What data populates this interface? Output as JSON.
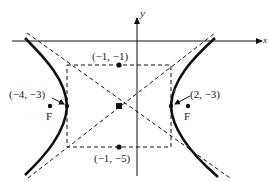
{
  "diagram": {
    "type": "hyperbola",
    "title": "",
    "axes": {
      "x_label": "x",
      "y_label": "y"
    },
    "center": {
      "label": "(-1, -3)",
      "coords": [
        -1,
        -3
      ]
    },
    "vertices": [
      {
        "label": "(−4, −3)",
        "coords": [
          -4,
          -3
        ]
      },
      {
        "label": "(2, −3)",
        "coords": [
          2,
          -3
        ]
      }
    ],
    "co_vertices": [
      {
        "label": "(−1, −1)",
        "coords": [
          -1,
          -1
        ]
      },
      {
        "label": "(−1, −5)",
        "coords": [
          -1,
          -5
        ]
      }
    ],
    "foci": [
      {
        "label": "F"
      },
      {
        "label": "F"
      }
    ],
    "elements": [
      "hyperbola branches (solid)",
      "asymptotes (dashed)",
      "fundamental rectangle (dashed)"
    ],
    "colors": {
      "ink": "#111111",
      "background": "#ffffff"
    }
  }
}
